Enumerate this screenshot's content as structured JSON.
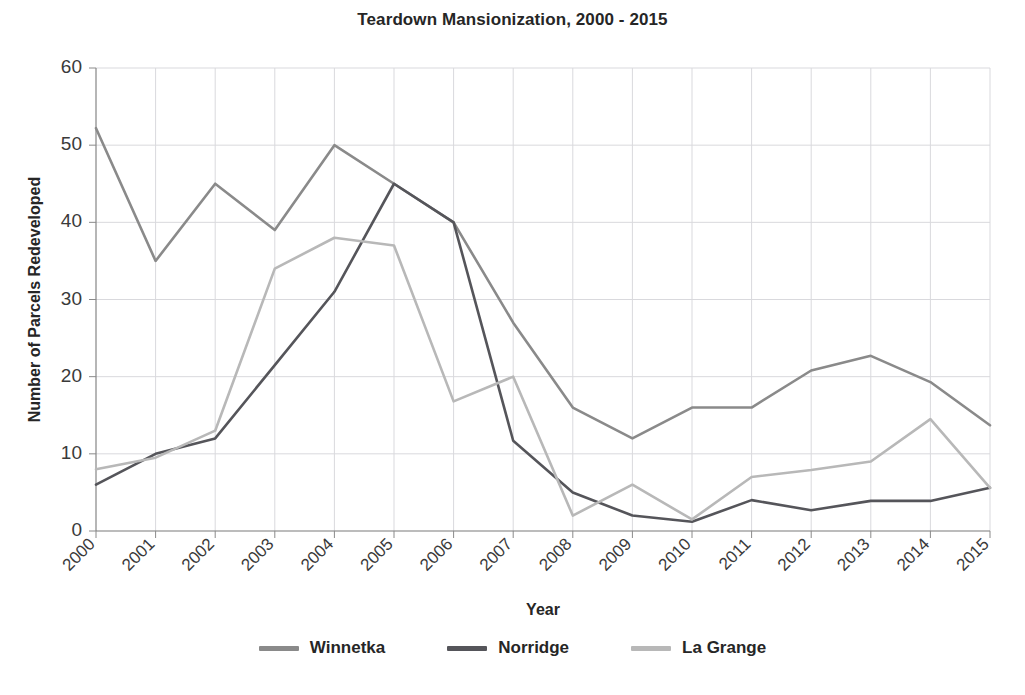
{
  "chart_data": {
    "type": "line",
    "title": "Teardown Mansionization, 2000 - 2015",
    "xlabel": "Year",
    "ylabel": "Number of Parcels Redeveloped",
    "categories": [
      "2000",
      "2001",
      "2002",
      "2003",
      "2004",
      "2005",
      "2006",
      "2007",
      "2008",
      "2009",
      "2010",
      "2011",
      "2012",
      "2013",
      "2014",
      "2015"
    ],
    "ylim": [
      0,
      60
    ],
    "yticks": [
      0,
      10,
      20,
      30,
      40,
      50,
      60
    ],
    "grid": true,
    "legend_position": "bottom",
    "xtick_rotation": 45,
    "series": [
      {
        "name": "Winnetka",
        "color": "#8a8a8a",
        "values": [
          52.2,
          35,
          45,
          39,
          50,
          45,
          40,
          27,
          16,
          12,
          16,
          16,
          20.8,
          22.7,
          19.3,
          13.7
        ]
      },
      {
        "name": "Norridge",
        "color": "#55555a",
        "values": [
          6,
          10,
          12,
          21.5,
          31,
          45,
          40,
          11.7,
          5,
          2,
          1.2,
          4,
          2.7,
          3.9,
          3.9,
          5.6
        ]
      },
      {
        "name": "La Grange",
        "color": "#b8b8b8",
        "values": [
          8,
          9.5,
          13,
          34,
          38,
          37,
          16.8,
          20,
          2,
          6,
          1.5,
          7,
          7.9,
          9,
          14.5,
          5.6
        ]
      }
    ]
  },
  "legend": {
    "items": [
      {
        "label": "Winnetka",
        "color": "#8a8a8a"
      },
      {
        "label": "Norridge",
        "color": "#55555a"
      },
      {
        "label": "La Grange",
        "color": "#b8b8b8"
      }
    ]
  }
}
